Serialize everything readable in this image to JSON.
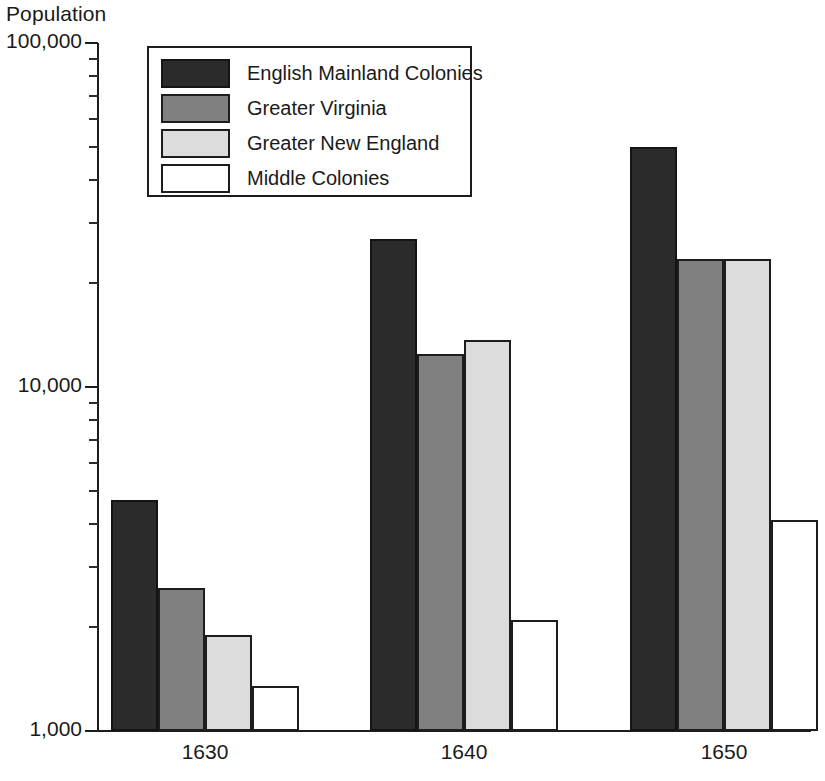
{
  "chart_data": {
    "type": "bar",
    "title": "",
    "ylabel": "Population",
    "xlabel": "",
    "categories": [
      "1630",
      "1640",
      "1650"
    ],
    "yscale": "log",
    "ylim": [
      1000,
      100000
    ],
    "ytick_labels": [
      "100,000",
      "10,000",
      "1,000"
    ],
    "ytick_values": [
      100000,
      10000,
      1000
    ],
    "yminor_ticks": [
      20000,
      30000,
      40000,
      50000,
      60000,
      70000,
      80000,
      90000,
      2000,
      3000,
      4000,
      5000,
      6000,
      7000,
      8000,
      9000
    ],
    "grid": false,
    "legend_position": "top-left",
    "series": [
      {
        "name": "English Mainland Colonies",
        "color": "#2b2b2b",
        "values": [
          4700,
          27000,
          50000
        ]
      },
      {
        "name": "Greater Virginia",
        "color": "#808080",
        "values": [
          2600,
          12500,
          23500
        ]
      },
      {
        "name": "Greater New England",
        "color": "#dcdcdc",
        "values": [
          1900,
          13700,
          23500
        ]
      },
      {
        "name": "Middle Colonies",
        "color": "#ffffff",
        "values": [
          1350,
          2100,
          4100
        ]
      }
    ]
  },
  "axis": {
    "y_title": "Population"
  },
  "legend": {
    "entries": [
      {
        "label": "English Mainland Colonies"
      },
      {
        "label": "Greater Virginia"
      },
      {
        "label": "Greater New England"
      },
      {
        "label": "Middle Colonies"
      }
    ]
  }
}
